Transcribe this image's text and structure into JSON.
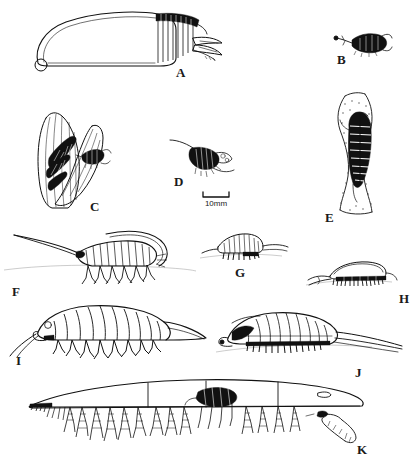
{
  "figure": {
    "background_color": "#ffffff",
    "ink_color": "#111111",
    "width": 417,
    "height": 460,
    "panel_count": 11
  },
  "scale_bar": {
    "label": "10mm",
    "x": 196,
    "y": 191,
    "bar_width": 26,
    "style": "bracket"
  },
  "panels": [
    {
      "id": "A",
      "label": "A",
      "label_x": 176,
      "label_y": 66,
      "caption": "Large ovoid host body in lateral view with segmented posterior and tail fan",
      "subject": "large-ovoid-body-with-segmented-tail"
    },
    {
      "id": "B",
      "label": "B",
      "label_x": 337,
      "label_y": 53,
      "caption": "Small dark stalked parasite, dorsal view",
      "subject": "small-dark-stalked-parasite"
    },
    {
      "id": "C",
      "label": "C",
      "label_x": 90,
      "label_y": 200,
      "caption": "Parasites attached within paired ribbed leaf-like blades",
      "subject": "parasites-on-ribbed-blades"
    },
    {
      "id": "D",
      "label": "D",
      "label_x": 174,
      "label_y": 175,
      "caption": "Small stippled parasite with trailing filament",
      "subject": "small-stippled-parasite"
    },
    {
      "id": "E",
      "label": "E",
      "label_x": 325,
      "label_y": 211,
      "caption": "Segmented isopod clasping a stippled vertical stalk",
      "subject": "isopod-on-vertical-stalk"
    },
    {
      "id": "F",
      "label": "F",
      "label_x": 12,
      "label_y": 285,
      "caption": "Long-antennaed segmented crustacean in lateral view with walking legs",
      "subject": "long-antennae-crustacean-lateral"
    },
    {
      "id": "G",
      "label": "G",
      "label_x": 235,
      "label_y": 266,
      "caption": "Small ribbed crustacean in lateral view with fine legs",
      "subject": "small-ribbed-crustacean"
    },
    {
      "id": "H",
      "label": "H",
      "label_x": 399,
      "label_y": 292,
      "caption": "Low flattened crustacean with dense ventral setae",
      "subject": "flattened-crustacean-with-setae"
    },
    {
      "id": "I",
      "label": "I",
      "label_x": 16,
      "label_y": 354,
      "caption": "Large segmented isopod in lateral view with pereopods and tapering telson",
      "subject": "large-segmented-isopod"
    },
    {
      "id": "J",
      "label": "J",
      "label_x": 355,
      "label_y": 366,
      "caption": "Segmented isopod in lateral view with long uropods",
      "subject": "segmented-isopod-long-uropods"
    },
    {
      "id": "K",
      "label": "K",
      "label_x": 357,
      "label_y": 443,
      "caption": "Elongate host body bearing numerous pendant stalked parasites along the ventral margin",
      "subject": "host-body-with-pendant-parasites"
    }
  ]
}
